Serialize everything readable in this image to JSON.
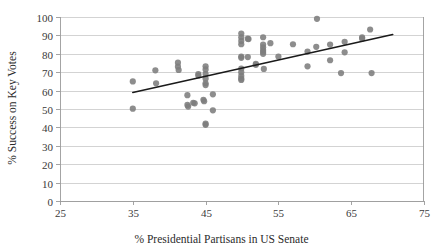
{
  "chart_data": {
    "type": "scatter",
    "title": "",
    "xlabel": "% Presidential Partisans in US Senate",
    "ylabel": "% Success on Key Votes",
    "xlim": [
      25,
      75
    ],
    "ylim": [
      0,
      100
    ],
    "xticks": [
      25,
      35,
      45,
      55,
      65,
      75
    ],
    "yticks": [
      0,
      10,
      20,
      30,
      40,
      50,
      60,
      70,
      80,
      90,
      100
    ],
    "grid": "horizontal",
    "legend": "none",
    "marker_color": "#7d7d7d",
    "trendline_color": "#1a1a1a",
    "gridline_color": "#c8c8c8",
    "axis_color": "#9a9a9a",
    "trendline": {
      "x_start": 35.0,
      "y_start": 59.0,
      "x_end": 70.7,
      "y_end": 90.5
    },
    "points": [
      {
        "x": 35.0,
        "y": 65.0
      },
      {
        "x": 35.0,
        "y": 50.2
      },
      {
        "x": 38.1,
        "y": 71.0
      },
      {
        "x": 38.2,
        "y": 64.0
      },
      {
        "x": 41.2,
        "y": 75.2
      },
      {
        "x": 41.2,
        "y": 73.0
      },
      {
        "x": 41.3,
        "y": 71.2
      },
      {
        "x": 42.5,
        "y": 57.5
      },
      {
        "x": 42.5,
        "y": 52.2
      },
      {
        "x": 42.6,
        "y": 51.3
      },
      {
        "x": 43.3,
        "y": 53.4
      },
      {
        "x": 43.5,
        "y": 53.1
      },
      {
        "x": 44.0,
        "y": 69.0
      },
      {
        "x": 44.0,
        "y": 68.2
      },
      {
        "x": 44.7,
        "y": 55.0
      },
      {
        "x": 44.8,
        "y": 54.2
      },
      {
        "x": 45.0,
        "y": 73.2
      },
      {
        "x": 45.0,
        "y": 71.5
      },
      {
        "x": 45.0,
        "y": 69.0
      },
      {
        "x": 45.0,
        "y": 66.5
      },
      {
        "x": 45.0,
        "y": 64.0
      },
      {
        "x": 45.0,
        "y": 63.0
      },
      {
        "x": 45.0,
        "y": 42.0
      },
      {
        "x": 45.0,
        "y": 41.4
      },
      {
        "x": 46.0,
        "y": 58.0
      },
      {
        "x": 46.0,
        "y": 49.3
      },
      {
        "x": 49.9,
        "y": 91.0
      },
      {
        "x": 49.9,
        "y": 89.0
      },
      {
        "x": 49.9,
        "y": 87.0
      },
      {
        "x": 49.9,
        "y": 85.2
      },
      {
        "x": 49.9,
        "y": 78.5
      },
      {
        "x": 49.9,
        "y": 77.8
      },
      {
        "x": 49.9,
        "y": 72.0
      },
      {
        "x": 49.9,
        "y": 70.0
      },
      {
        "x": 49.9,
        "y": 68.0
      },
      {
        "x": 49.9,
        "y": 66.5
      },
      {
        "x": 49.9,
        "y": 65.8
      },
      {
        "x": 50.8,
        "y": 88.2
      },
      {
        "x": 50.9,
        "y": 88.0
      },
      {
        "x": 50.8,
        "y": 78.2
      },
      {
        "x": 51.9,
        "y": 74.5
      },
      {
        "x": 51.9,
        "y": 74.0
      },
      {
        "x": 52.9,
        "y": 89.0
      },
      {
        "x": 52.9,
        "y": 85.0
      },
      {
        "x": 52.9,
        "y": 83.5
      },
      {
        "x": 52.9,
        "y": 82.0
      },
      {
        "x": 52.9,
        "y": 81.0
      },
      {
        "x": 52.9,
        "y": 80.0
      },
      {
        "x": 53.0,
        "y": 71.8
      },
      {
        "x": 53.9,
        "y": 85.8
      },
      {
        "x": 55.0,
        "y": 78.5
      },
      {
        "x": 57.0,
        "y": 85.2
      },
      {
        "x": 59.0,
        "y": 81.2
      },
      {
        "x": 59.0,
        "y": 73.2
      },
      {
        "x": 60.3,
        "y": 99.0
      },
      {
        "x": 60.2,
        "y": 83.8
      },
      {
        "x": 62.1,
        "y": 85.0
      },
      {
        "x": 62.1,
        "y": 76.5
      },
      {
        "x": 63.6,
        "y": 69.5
      },
      {
        "x": 64.1,
        "y": 86.5
      },
      {
        "x": 64.1,
        "y": 80.8
      },
      {
        "x": 66.5,
        "y": 89.0
      },
      {
        "x": 66.5,
        "y": 88.2
      },
      {
        "x": 67.6,
        "y": 93.2
      },
      {
        "x": 67.8,
        "y": 69.5
      }
    ]
  }
}
